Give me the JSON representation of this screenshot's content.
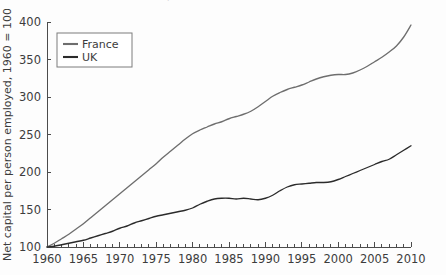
{
  "figure": {
    "cutoff_caption_ghost": "continued caption text",
    "background_color": "#fdfdfd"
  },
  "chart_data": {
    "type": "line",
    "title": "",
    "subtitle": "",
    "xlabel": "",
    "ylabel": "Net capital per person employed, 1960 = 100",
    "xlim": [
      1960,
      2010
    ],
    "ylim": [
      100,
      400
    ],
    "xticks": [
      1960,
      1965,
      1970,
      1975,
      1980,
      1985,
      1990,
      1995,
      2000,
      2005,
      2010
    ],
    "xtick_labels": [
      "1960",
      "1965",
      "1970",
      "1975",
      "1980",
      "1985",
      "1990",
      "1995",
      "2000",
      "2005",
      "2010"
    ],
    "yticks": [
      100,
      150,
      200,
      250,
      300,
      350,
      400
    ],
    "ytick_labels": [
      "100",
      "150",
      "200",
      "250",
      "300",
      "350",
      "400"
    ],
    "minor_xtick_interval": 1,
    "grid": false,
    "legend": {
      "position": "upper-left-inside",
      "entries": [
        {
          "name": "France",
          "color": "#6e6e6e"
        },
        {
          "name": "UK",
          "color": "#2b2b2b"
        }
      ]
    },
    "x": [
      1960,
      1961,
      1962,
      1963,
      1964,
      1965,
      1966,
      1967,
      1968,
      1969,
      1970,
      1971,
      1972,
      1973,
      1974,
      1975,
      1976,
      1977,
      1978,
      1979,
      1980,
      1981,
      1982,
      1983,
      1984,
      1985,
      1986,
      1987,
      1988,
      1989,
      1990,
      1991,
      1992,
      1993,
      1994,
      1995,
      1996,
      1997,
      1998,
      1999,
      2000,
      2001,
      2002,
      2003,
      2004,
      2005,
      2006,
      2007,
      2008,
      2009,
      2010
    ],
    "series": [
      {
        "name": "France",
        "color": "#6e6e6e",
        "values": [
          100,
          105,
          111,
          117,
          124,
          131,
          139,
          147,
          155,
          163,
          171,
          179,
          187,
          195,
          203,
          211,
          220,
          228,
          236,
          244,
          251,
          256,
          260,
          264,
          267,
          271,
          274,
          277,
          281,
          287,
          294,
          301,
          306,
          310,
          313,
          316,
          320,
          324,
          327,
          329,
          330,
          330,
          332,
          336,
          341,
          347,
          353,
          360,
          368,
          380,
          396
        ]
      },
      {
        "name": "UK",
        "color": "#2b2b2b",
        "values": [
          100,
          101,
          103,
          105,
          107,
          109,
          112,
          115,
          118,
          121,
          125,
          128,
          132,
          135,
          138,
          141,
          143,
          145,
          147,
          149,
          152,
          157,
          161,
          164,
          165,
          165,
          164,
          165,
          164,
          163,
          165,
          169,
          175,
          180,
          183,
          184,
          185,
          186,
          186,
          187,
          190,
          194,
          198,
          202,
          206,
          210,
          214,
          217,
          223,
          229,
          235
        ]
      }
    ]
  }
}
